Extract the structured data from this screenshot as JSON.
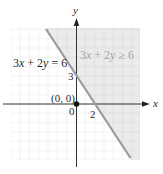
{
  "figure": {
    "equation_label": {
      "a": "3",
      "x": "x",
      "mid": " + 2",
      "y": "y",
      "rhs": " = 6"
    },
    "inequality_label": {
      "a": "3",
      "x": "x",
      "mid": " + 2",
      "y": "y",
      "rhs": " ≥ 6"
    },
    "point_label": "(0, 0)",
    "origin_label": "0",
    "y_intercept_label": "3",
    "x_intercept_label": "2",
    "x_axis_label": "x",
    "y_axis_label": "y",
    "colors": {
      "shade": "#ebebeb",
      "grid_shaded": "#dcdcdc",
      "grid_unshaded": "#f0f0f0",
      "boundary_line": "#9a9a9a",
      "axis": "#333333",
      "inequality_text": "#a3a3a3"
    }
  },
  "graph": {
    "boundary": {
      "equation": "3x + 2y = 6",
      "type": "solid",
      "x_intercept": 2,
      "y_intercept": 3
    },
    "shaded_region": "3x + 2y ≥ 6",
    "test_point": [
      0,
      0
    ],
    "x_range": [
      -7,
      7
    ],
    "y_range": [
      -6,
      8
    ]
  }
}
